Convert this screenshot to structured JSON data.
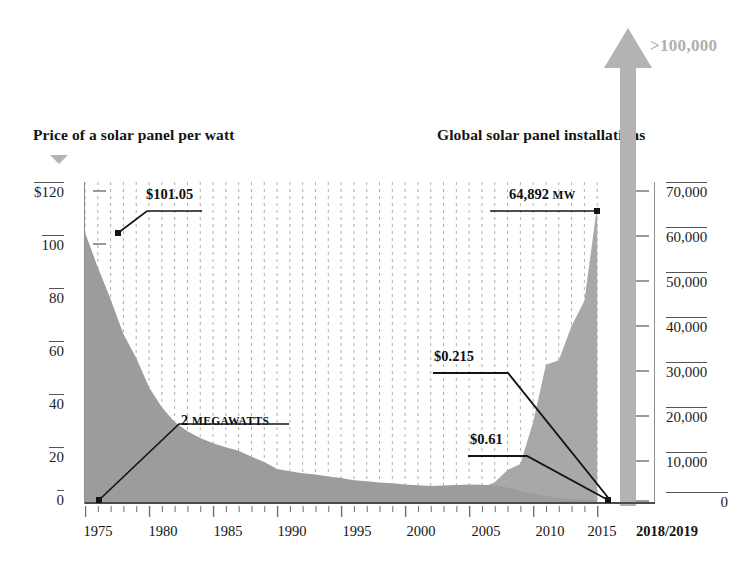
{
  "headings": {
    "left_title": "Price of a solar panel per watt",
    "right_title": "Global solar panel installations"
  },
  "arrow": {
    "label": ">100,000",
    "color": "#b3b3b3",
    "icon": "up-arrow-icon"
  },
  "marker": {
    "icon": "down-triangle-icon",
    "color": "#b3b3b3"
  },
  "annotations": {
    "price_start": "$101.05",
    "price_2008": "$0.215",
    "price_2011": "$0.61",
    "installs_1975_value": "2",
    "installs_1975_unit": "MEGAWATTS",
    "installs_2015_value": "64,892",
    "installs_2015_unit": "MW"
  },
  "chart_data": {
    "type": "area",
    "xlabel": "",
    "ylabel": "Price of a solar panel per watt",
    "y2label": "Global solar panel installations",
    "grid": true,
    "legend_position": "none",
    "xlim": [
      1975,
      2016
    ],
    "ylim": [
      0,
      120
    ],
    "y2lim": [
      0,
      70000
    ],
    "x_tick_labels": [
      "1975",
      "1980",
      "1985",
      "1990",
      "1995",
      "2000",
      "2005",
      "2010",
      "2015",
      "2018/2019"
    ],
    "y_tick_labels": [
      "$120",
      "100",
      "80",
      "60",
      "40",
      "20",
      "0"
    ],
    "y_ticks": [
      120,
      100,
      80,
      60,
      40,
      20,
      0
    ],
    "y2_tick_labels": [
      "70,000",
      "60,000",
      "50,000",
      "40,000",
      "30,000",
      "20,000",
      "10,000",
      "0"
    ],
    "y2_ticks": [
      70000,
      60000,
      50000,
      40000,
      30000,
      20000,
      10000,
      0
    ],
    "x": [
      1975,
      1976,
      1977,
      1978,
      1979,
      1980,
      1981,
      1982,
      1983,
      1984,
      1985,
      1986,
      1987,
      1988,
      1989,
      1990,
      1991,
      1992,
      1993,
      1994,
      1995,
      1996,
      1997,
      1998,
      1999,
      2000,
      2001,
      2002,
      2003,
      2004,
      2005,
      2006,
      2007,
      2008,
      2009,
      2010,
      2011,
      2012,
      2013,
      2014,
      2015
    ],
    "series": [
      {
        "name": "Price of a solar panel per watt",
        "axis": "left",
        "units": "USD per watt",
        "color": "#9c9c9c",
        "values": [
          101.05,
          88.0,
          76.0,
          63.0,
          54.0,
          43.0,
          35.5,
          30.0,
          26.5,
          24.0,
          22.0,
          20.5,
          19.2,
          17.0,
          15.0,
          12.4,
          11.5,
          10.8,
          10.3,
          9.6,
          9.0,
          8.2,
          7.8,
          7.3,
          7.0,
          6.6,
          6.3,
          6.0,
          6.2,
          6.4,
          6.6,
          6.5,
          6.2,
          5.4,
          4.1,
          3.1,
          2.2,
          1.35,
          1.05,
          0.92,
          0.61
        ]
      },
      {
        "name": "Global solar panel installations",
        "axis": "right",
        "units": "MW",
        "color": "#a8a8a8",
        "values": [
          2,
          5,
          9,
          14,
          20,
          27,
          35,
          44,
          55,
          68,
          82,
          96,
          110,
          125,
          140,
          155,
          170,
          185,
          205,
          230,
          260,
          300,
          350,
          420,
          520,
          660,
          840,
          1100,
          1400,
          2000,
          2800,
          3100,
          4300,
          7000,
          8300,
          17500,
          30000,
          31000,
          38500,
          44000,
          64892
        ]
      }
    ],
    "annotations": [
      {
        "label": "$101.05",
        "x": 1975,
        "y": 101.05,
        "axis": "left"
      },
      {
        "label": "$0.215",
        "x": 2008,
        "y": 0.215,
        "axis": "left"
      },
      {
        "label": "$0.61",
        "x": 2015,
        "y": 0.61,
        "axis": "left"
      },
      {
        "label": "2 MEGAWATTS",
        "x": 1975,
        "y": 2,
        "axis": "right"
      },
      {
        "label": "64,892 MW",
        "x": 2015,
        "y": 64892,
        "axis": "right"
      },
      {
        "label": ">100,000",
        "x": 2018.5,
        "y": 100000,
        "axis": "right"
      }
    ]
  }
}
